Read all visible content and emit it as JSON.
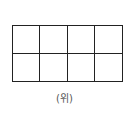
{
  "diagram": {
    "rows": 2,
    "columns": 4,
    "caption": "(위)"
  }
}
